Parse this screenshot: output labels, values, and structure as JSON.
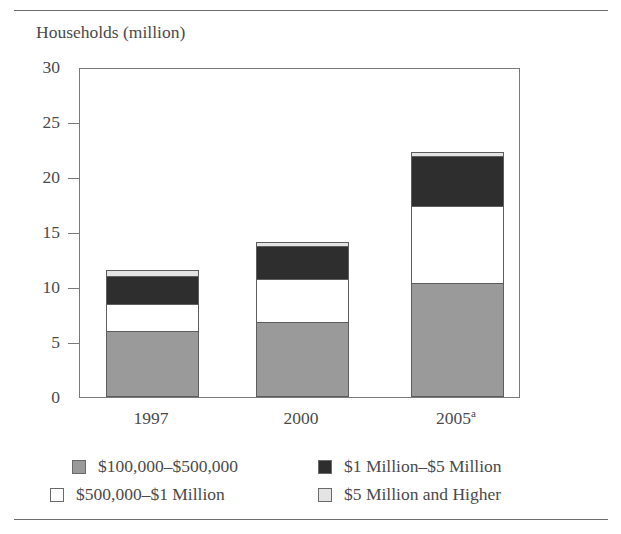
{
  "figure": {
    "axis_title": "Households (million)",
    "clipped_heading": ""
  },
  "chart_data": {
    "type": "bar",
    "subtype": "stacked-bar",
    "title": "",
    "xlabel": "",
    "ylabel": "Households (million)",
    "ylim": [
      0,
      30
    ],
    "yticks": [
      0,
      5,
      10,
      15,
      20,
      25,
      30
    ],
    "ytick_labels": [
      "0",
      "5",
      "10",
      "15",
      "20",
      "25",
      "30"
    ],
    "grid": false,
    "legend_position": "below-axes",
    "categories": [
      "1997",
      "2000",
      "2005"
    ],
    "category_labels": [
      {
        "text": "1997",
        "superscript": ""
      },
      {
        "text": "2000",
        "superscript": ""
      },
      {
        "text": "2005",
        "superscript": "a"
      }
    ],
    "series": [
      {
        "name": "$100,000–$500,000",
        "color": "#9a9a9a",
        "values": [
          5.9,
          6.7,
          10.3
        ]
      },
      {
        "name": "$500,000–$1 Million",
        "color": "#ffffff",
        "values": [
          2.5,
          3.9,
          7.0
        ]
      },
      {
        "name": "$1 Million–$5 Million",
        "color": "#2e2e2e",
        "values": [
          2.5,
          3.0,
          4.5
        ]
      },
      {
        "name": "$5 Million and Higher",
        "color": "#e4e4e4",
        "values": [
          0.6,
          0.4,
          0.4
        ]
      }
    ],
    "totals": [
      11.4,
      14.0,
      22.2
    ]
  },
  "legend": {
    "items": [
      {
        "label": "$100,000–$500,000",
        "swatch": "s0"
      },
      {
        "label": "$500,000–$1 Million",
        "swatch": "s1"
      },
      {
        "label": "$1 Million–$5 Million",
        "swatch": "s2"
      },
      {
        "label": "$5 Million and Higher",
        "swatch": "s3"
      }
    ]
  },
  "colors": {
    "series_0": "#9a9a9a",
    "series_1": "#ffffff",
    "series_2": "#2e2e2e",
    "series_3": "#e4e4e4",
    "axis": "#7a7a7a",
    "text": "#4a4a4a",
    "rule": "#6d6d6d"
  }
}
